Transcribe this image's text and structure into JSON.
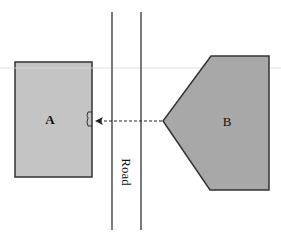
{
  "diagram": {
    "building_a": {
      "label": "A",
      "fill": "#c4c4c4",
      "stroke": "#333333"
    },
    "building_b": {
      "label": "B",
      "fill": "#a8a8a8",
      "stroke": "#333333"
    },
    "road": {
      "label": "Road",
      "line_color": "#333333"
    },
    "arrow": {
      "style": "dashed",
      "direction": "B-to-A"
    },
    "guide_line_color": "#d8d8d8"
  }
}
